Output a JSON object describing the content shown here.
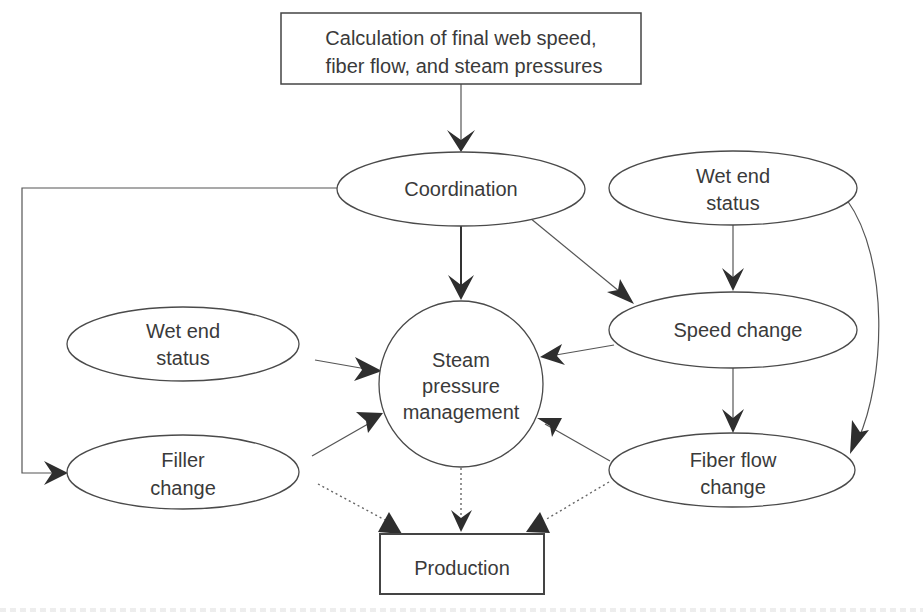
{
  "diagram": {
    "colors": {
      "stroke": "#4a4a4a",
      "arrowhead": "#2e2e2e",
      "text": "#3a3a3a",
      "background": "#ffffff"
    },
    "nodes": {
      "calculation": {
        "shape": "rectangle",
        "line1": "Calculation of final web speed,",
        "line2": "fiber flow, and steam pressures"
      },
      "coordination": {
        "shape": "ellipse",
        "label": "Coordination"
      },
      "wet_end_status_right": {
        "shape": "ellipse",
        "line1": "Wet end",
        "line2": "status"
      },
      "wet_end_status_left": {
        "shape": "ellipse",
        "line1": "Wet end",
        "line2": "status"
      },
      "speed_change": {
        "shape": "ellipse",
        "label": "Speed change"
      },
      "steam_pressure_management": {
        "shape": "circle",
        "line1": "Steam",
        "line2": "pressure",
        "line3": "management"
      },
      "filler_change": {
        "shape": "ellipse",
        "line1": "Filler",
        "line2": "change"
      },
      "fiber_flow_change": {
        "shape": "ellipse",
        "line1": "Fiber flow",
        "line2": "change"
      },
      "production": {
        "shape": "rectangle",
        "label": "Production"
      }
    },
    "edges": [
      {
        "from": "calculation",
        "to": "coordination",
        "style": "solid"
      },
      {
        "from": "coordination",
        "to": "steam_pressure_management",
        "style": "solid-bold"
      },
      {
        "from": "coordination",
        "to": "speed_change",
        "style": "solid"
      },
      {
        "from": "coordination",
        "to": "filler_change",
        "style": "solid-elbow"
      },
      {
        "from": "wet_end_status_right",
        "to": "speed_change",
        "style": "solid"
      },
      {
        "from": "wet_end_status_right",
        "to": "fiber_flow_change",
        "style": "solid-curved"
      },
      {
        "from": "wet_end_status_left",
        "to": "steam_pressure_management",
        "style": "solid"
      },
      {
        "from": "speed_change",
        "to": "steam_pressure_management",
        "style": "solid"
      },
      {
        "from": "speed_change",
        "to": "fiber_flow_change",
        "style": "solid"
      },
      {
        "from": "filler_change",
        "to": "steam_pressure_management",
        "style": "solid"
      },
      {
        "from": "fiber_flow_change",
        "to": "steam_pressure_management",
        "style": "solid"
      },
      {
        "from": "filler_change",
        "to": "production",
        "style": "dotted"
      },
      {
        "from": "steam_pressure_management",
        "to": "production",
        "style": "dotted"
      },
      {
        "from": "fiber_flow_change",
        "to": "production",
        "style": "dotted"
      }
    ]
  }
}
